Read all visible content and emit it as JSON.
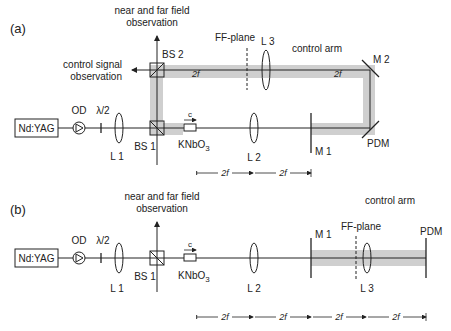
{
  "panel_a": {
    "tag": "(a)",
    "laser": "Nd:YAG",
    "od": "OD",
    "halfwave": "λ/2",
    "l1": "L 1",
    "bs1": "BS 1",
    "bs2": "BS 2",
    "crystal": "KNbO",
    "crystal_sub": "3",
    "c_axis": "c",
    "l2": "L 2",
    "l3": "L 3",
    "m1": "M 1",
    "m2": "M 2",
    "pdm": "PDM",
    "ff_plane": "FF-plane",
    "control_arm": "control arm",
    "nf_ff_line1": "near and far field",
    "nf_ff_line2": "observation",
    "cs_line1": "control signal",
    "cs_line2": "observation",
    "twof_a": "2f",
    "twof_b": "2f",
    "dims": [
      "2f",
      "2f"
    ]
  },
  "panel_b": {
    "tag": "(b)",
    "laser": "Nd:YAG",
    "od": "OD",
    "halfwave": "λ/2",
    "l1": "L 1",
    "bs1": "BS 1",
    "crystal": "KNbO",
    "crystal_sub": "3",
    "c_axis": "c",
    "l2": "L 2",
    "l3": "L 3",
    "m1": "M 1",
    "pdm": "PDM",
    "ff_plane": "FF-plane",
    "control_arm": "control arm",
    "nf_ff_line1": "near and far field",
    "nf_ff_line2": "observation",
    "dims": [
      "2f",
      "2f",
      "2f",
      "2f"
    ]
  }
}
